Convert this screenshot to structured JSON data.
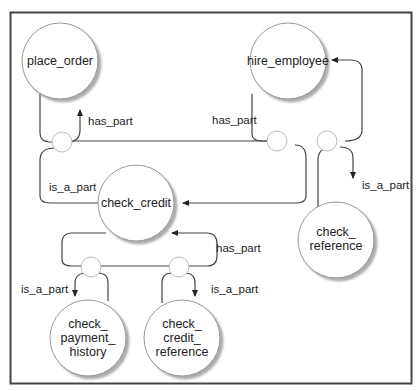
{
  "diagram": {
    "type": "semantic-network",
    "nodes": [
      {
        "id": "place_order",
        "lines": [
          "place_order"
        ]
      },
      {
        "id": "hire_employee",
        "lines": [
          "hire_employee"
        ]
      },
      {
        "id": "check_credit",
        "lines": [
          "check_credit"
        ]
      },
      {
        "id": "check_reference",
        "lines": [
          "check_",
          "reference"
        ]
      },
      {
        "id": "check_payment_history",
        "lines": [
          "check_",
          "payment_",
          "history"
        ]
      },
      {
        "id": "check_credit_reference",
        "lines": [
          "check_",
          "credit_",
          "reference"
        ]
      }
    ],
    "edge_labels": {
      "place_order_has_part": "has_part",
      "hire_employee_has_part": "has_part",
      "check_credit_is_a_part": "is_a_part",
      "check_reference_is_a_part": "is_a_part",
      "check_credit_has_part": "has_part",
      "payment_history_is_a_part": "is_a_part",
      "credit_reference_is_a_part": "is_a_part"
    },
    "relations": [
      {
        "from": "check_credit",
        "relation": "is_a_part",
        "to": "place_order"
      },
      {
        "from": "place_order",
        "relation": "has_part",
        "to": "check_credit"
      },
      {
        "from": "check_credit",
        "relation": "is_a_part",
        "to": "hire_employee"
      },
      {
        "from": "hire_employee",
        "relation": "has_part",
        "to": "check_credit"
      },
      {
        "from": "check_reference",
        "relation": "is_a_part",
        "to": "hire_employee"
      },
      {
        "from": "hire_employee",
        "relation": "has_part",
        "to": "check_reference"
      },
      {
        "from": "check_payment_history",
        "relation": "is_a_part",
        "to": "check_credit"
      },
      {
        "from": "check_credit",
        "relation": "has_part",
        "to": "check_payment_history"
      },
      {
        "from": "check_credit_reference",
        "relation": "is_a_part",
        "to": "check_credit"
      },
      {
        "from": "check_credit",
        "relation": "has_part",
        "to": "check_credit_reference"
      }
    ]
  }
}
